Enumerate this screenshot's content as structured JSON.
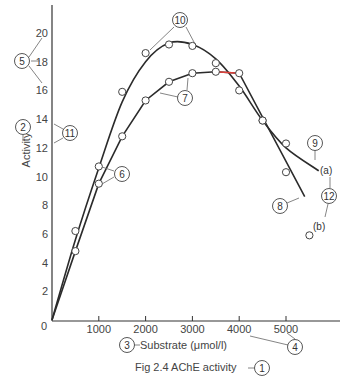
{
  "chart_data": {
    "type": "line",
    "title": "Fig 2.4  AChE activity",
    "xlabel": "Substrate (μmol/l)",
    "ylabel": "Activity",
    "xlim": [
      0,
      5800
    ],
    "ylim": [
      0,
      21
    ],
    "grid": false,
    "x_ticks": [
      0,
      1000,
      2000,
      3000,
      4000,
      5000
    ],
    "x_tick_labels": [
      "0",
      "1000",
      "2000",
      "3000",
      "4000",
      "5000"
    ],
    "y_ticks": [
      2,
      4,
      6,
      8,
      10,
      12,
      14,
      16,
      18,
      20
    ],
    "y_tick_labels": [
      "2",
      "4",
      "6",
      "8",
      "10",
      "12",
      "14",
      "16",
      "18",
      "20"
    ],
    "series": [
      {
        "name": "(a)",
        "x": [
          500,
          1000,
          1500,
          2000,
          2500,
          3000,
          3500,
          4000,
          4500,
          5000
        ],
        "values": [
          6.2,
          10.7,
          15.9,
          18.6,
          19.2,
          19.1,
          17.9,
          16.0,
          13.9,
          12.3
        ],
        "curve_end": [
          5700,
          10.4
        ]
      },
      {
        "name": "(b)",
        "x": [
          500,
          1000,
          1500,
          2000,
          2500,
          3000,
          3500,
          4000,
          4500,
          5000,
          5500
        ],
        "values": [
          4.8,
          9.5,
          12.8,
          15.3,
          16.6,
          17.2,
          17.3,
          17.2,
          13.9,
          10.3,
          5.9
        ],
        "curve_end": [
          5400,
          8.6
        ],
        "highlight_segment": {
          "from_x": 3500,
          "to_x": 4000,
          "color": "#e0403a"
        }
      }
    ],
    "annotations": [
      {
        "id": "1",
        "label": "1",
        "target": "figure caption"
      },
      {
        "id": "2",
        "label": "2",
        "target": "y-axis title"
      },
      {
        "id": "3",
        "label": "3",
        "target": "x-axis title"
      },
      {
        "id": "4",
        "label": "4",
        "target": "x tick labels"
      },
      {
        "id": "5",
        "label": "5",
        "target": "y tick labels"
      },
      {
        "id": "6",
        "label": "6",
        "target": "data points"
      },
      {
        "id": "7",
        "label": "7",
        "target": "curve (b)"
      },
      {
        "id": "8",
        "label": "8",
        "target": "curve (b) line"
      },
      {
        "id": "9",
        "label": "9",
        "target": "curve (a) line"
      },
      {
        "id": "10",
        "label": "10",
        "target": "data points peak"
      },
      {
        "id": "11",
        "label": "11",
        "target": "y-axis line"
      },
      {
        "id": "12",
        "label": "12",
        "target": "series labels"
      }
    ]
  },
  "labels": {
    "caption": "Fig 2.4  AChE activity",
    "xlabel": "Substrate (μmol/l)",
    "ylabel": "Activity",
    "origin": "0",
    "series_a": "(a)",
    "series_b": "(b)"
  },
  "colors": {
    "line": "#2b2b2b",
    "callout": "#666666",
    "highlight": "#e0403a"
  }
}
